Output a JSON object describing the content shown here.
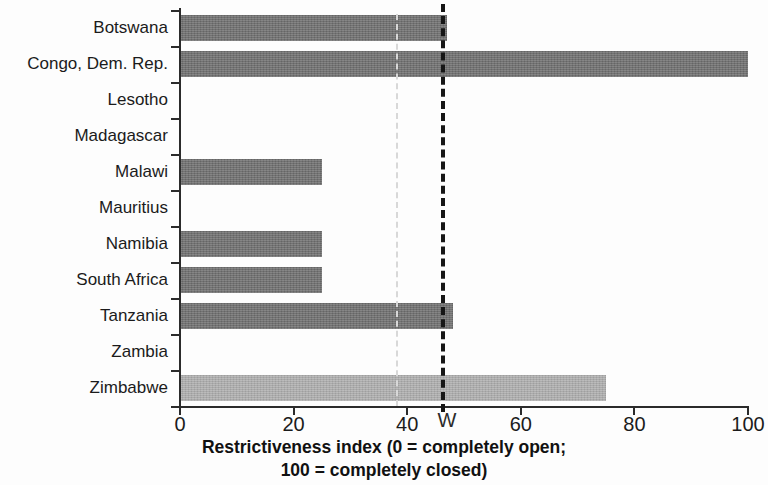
{
  "chart_data": {
    "type": "bar",
    "orientation": "horizontal",
    "title": "",
    "xlabel": "Restrictiveness index (0 = completely open; 100 = completely closed)",
    "xlabel_line1": "Restrictiveness index (0 = completely open;",
    "xlabel_line2": "100 = completely closed)",
    "ylabel": "",
    "categories": [
      "Botswana",
      "Congo, Dem. Rep.",
      "Lesotho",
      "Madagascar",
      "Malawi",
      "Mauritius",
      "Namibia",
      "South Africa",
      "Tanzania",
      "Zambia",
      "Zimbabwe"
    ],
    "values": [
      47,
      100,
      0,
      0,
      25,
      0,
      25,
      25,
      48,
      0,
      75
    ],
    "bar_colors": [
      "#6e6e6e",
      "#6e6e6e",
      "#6e6e6e",
      "#6e6e6e",
      "#6e6e6e",
      "#6e6e6e",
      "#6e6e6e",
      "#6e6e6e",
      "#6e6e6e",
      "#6e6e6e",
      "#aeaeae"
    ],
    "xlim": [
      0,
      100
    ],
    "xticks": [
      0,
      20,
      40,
      60,
      80,
      100
    ],
    "xtick_labels": [
      "0",
      "20",
      "40",
      "60",
      "80",
      "100"
    ],
    "grid": false,
    "legend": null,
    "reference_lines": [
      {
        "name": "average-reference-line",
        "value": 46,
        "style": "dashed",
        "color": "#161616"
      },
      {
        "name": "secondary-reference-line",
        "value": 38,
        "style": "dashed",
        "color": "#d8d8d8"
      }
    ],
    "annotations": [
      {
        "name": "scan-artifact",
        "text": "W",
        "x": 47
      }
    ]
  }
}
